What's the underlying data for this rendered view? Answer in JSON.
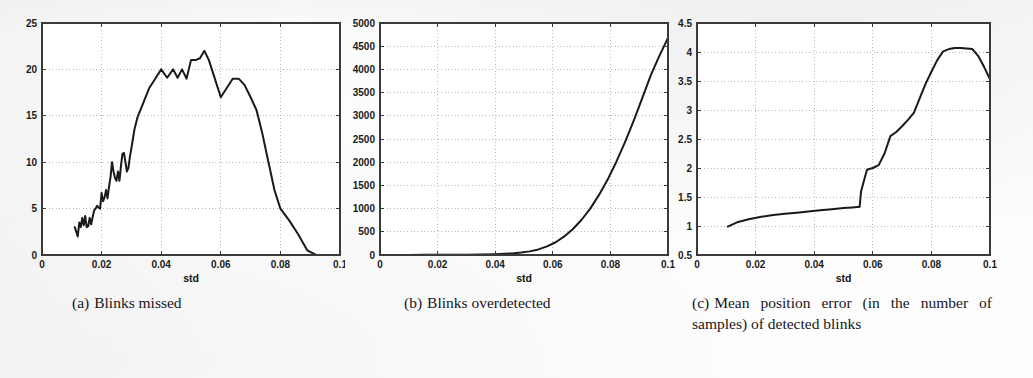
{
  "figure": {
    "background_color": "#fdfdfd",
    "line_color": "#1a1a1a",
    "grid_color": "#9a9a9a",
    "axis_color": "#3a3a3a"
  },
  "captions": [
    {
      "label": "(a)",
      "text": "Blinks missed"
    },
    {
      "label": "(b)",
      "text": "Blinks overdetected"
    },
    {
      "label": "(c)",
      "text": "Mean position error (in the number of samples) of detected blinks"
    }
  ],
  "chart_data": [
    {
      "id": "blinks-missed",
      "type": "line",
      "title": "",
      "xlabel": "std",
      "ylabel": "",
      "xlim": [
        0,
        0.1
      ],
      "ylim": [
        0,
        25
      ],
      "xticks": [
        0,
        0.02,
        0.04,
        0.06,
        0.08,
        0.1
      ],
      "xticklabels": [
        "0",
        "0.02",
        "0.04",
        "0.06",
        "0.08",
        "0.1"
      ],
      "yticks": [
        0,
        5,
        10,
        15,
        20,
        25
      ],
      "yticklabels": [
        "0",
        "5",
        "10",
        "15",
        "20",
        "25"
      ],
      "grid": true,
      "legend": null,
      "x": [
        0.011,
        0.012,
        0.0125,
        0.013,
        0.0135,
        0.014,
        0.0145,
        0.015,
        0.0155,
        0.016,
        0.0165,
        0.017,
        0.0175,
        0.018,
        0.0185,
        0.019,
        0.0195,
        0.02,
        0.0205,
        0.021,
        0.0215,
        0.022,
        0.0225,
        0.023,
        0.0235,
        0.024,
        0.0245,
        0.025,
        0.0255,
        0.026,
        0.0265,
        0.027,
        0.0275,
        0.028,
        0.0285,
        0.029,
        0.0295,
        0.03,
        0.0305,
        0.031,
        0.032,
        0.034,
        0.036,
        0.038,
        0.04,
        0.042,
        0.044,
        0.0455,
        0.047,
        0.0485,
        0.05,
        0.0515,
        0.053,
        0.0545,
        0.056,
        0.058,
        0.06,
        0.062,
        0.064,
        0.066,
        0.068,
        0.07,
        0.072,
        0.074,
        0.076,
        0.078,
        0.08,
        0.083,
        0.086,
        0.089,
        0.092,
        0.096,
        0.1
      ],
      "y": [
        3.0,
        2.0,
        3.5,
        3.0,
        4.0,
        3.2,
        4.2,
        3.0,
        3.1,
        4.0,
        3.3,
        4.1,
        4.8,
        5.0,
        5.3,
        5.1,
        5.0,
        6.7,
        5.8,
        6.2,
        7.0,
        6.1,
        7.4,
        8.4,
        10.0,
        9.0,
        8.3,
        8.0,
        9.0,
        8.0,
        9.6,
        10.9,
        11.0,
        10.0,
        9.0,
        9.4,
        10.6,
        11.5,
        12.5,
        13.5,
        14.8,
        16.4,
        18.0,
        19.0,
        20.0,
        19.1,
        20.0,
        19.1,
        20.0,
        19.0,
        21.0,
        21.0,
        21.2,
        22.0,
        21.0,
        19.0,
        17.0,
        18.0,
        19.0,
        19.0,
        18.3,
        17.0,
        15.6,
        13.0,
        10.0,
        7.0,
        5.0,
        3.7,
        2.2,
        0.5,
        0.0,
        0.0,
        0.0
      ]
    },
    {
      "id": "blinks-overdetected",
      "type": "line",
      "title": "",
      "xlabel": "std",
      "ylabel": "",
      "xlim": [
        0,
        0.1
      ],
      "ylim": [
        0,
        5000
      ],
      "xticks": [
        0,
        0.02,
        0.04,
        0.06,
        0.08,
        0.1
      ],
      "xticklabels": [
        "0",
        "0.02",
        "0.04",
        "0.06",
        "0.08",
        "0.1"
      ],
      "yticks": [
        0,
        500,
        1000,
        1500,
        2000,
        2500,
        3000,
        3500,
        4000,
        4500,
        5000
      ],
      "yticklabels": [
        "0",
        "500",
        "1000",
        "1500",
        "2000",
        "2500",
        "3000",
        "3500",
        "4000",
        "4500",
        "5000"
      ],
      "grid": true,
      "legend": null,
      "x": [
        0.01,
        0.015,
        0.02,
        0.025,
        0.03,
        0.035,
        0.04,
        0.043,
        0.046,
        0.049,
        0.052,
        0.055,
        0.058,
        0.061,
        0.064,
        0.067,
        0.07,
        0.073,
        0.076,
        0.079,
        0.082,
        0.085,
        0.088,
        0.091,
        0.094,
        0.097,
        0.1
      ],
      "y": [
        2,
        3,
        4,
        6,
        8,
        12,
        18,
        25,
        35,
        52,
        78,
        120,
        185,
        275,
        400,
        560,
        760,
        1000,
        1290,
        1620,
        2000,
        2420,
        2880,
        3370,
        3870,
        4290,
        4680
      ]
    },
    {
      "id": "mean-position-error",
      "type": "line",
      "title": "",
      "xlabel": "std",
      "ylabel": "",
      "xlim": [
        0,
        0.1
      ],
      "ylim": [
        0.5,
        4.5
      ],
      "xticks": [
        0,
        0.02,
        0.04,
        0.06,
        0.08,
        0.1
      ],
      "xticklabels": [
        "0",
        "0.02",
        "0.04",
        "0.06",
        "0.08",
        "0.1"
      ],
      "yticks": [
        0.5,
        1,
        1.5,
        2,
        2.5,
        3,
        3.5,
        4,
        4.5
      ],
      "yticklabels": [
        "0.5",
        "1",
        "1.5",
        "2",
        "2.5",
        "3",
        "3.5",
        "4",
        "4.5"
      ],
      "grid": true,
      "legend": null,
      "x": [
        0.0105,
        0.014,
        0.018,
        0.022,
        0.026,
        0.03,
        0.034,
        0.038,
        0.042,
        0.046,
        0.05,
        0.053,
        0.0555,
        0.056,
        0.058,
        0.06,
        0.062,
        0.064,
        0.066,
        0.068,
        0.07,
        0.072,
        0.074,
        0.076,
        0.078,
        0.08,
        0.082,
        0.084,
        0.086,
        0.088,
        0.09,
        0.092,
        0.094,
        0.096,
        0.098,
        0.1
      ],
      "y": [
        0.99,
        1.07,
        1.12,
        1.16,
        1.19,
        1.21,
        1.23,
        1.25,
        1.27,
        1.29,
        1.31,
        1.32,
        1.33,
        1.6,
        1.97,
        2.0,
        2.05,
        2.25,
        2.55,
        2.62,
        2.72,
        2.83,
        2.95,
        3.2,
        3.45,
        3.66,
        3.86,
        4.01,
        4.05,
        4.07,
        4.07,
        4.06,
        4.05,
        3.93,
        3.74,
        3.53
      ]
    }
  ]
}
